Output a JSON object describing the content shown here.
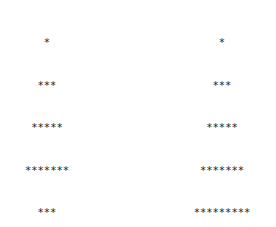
{
  "trees": [
    {
      "id": "left",
      "rows": [
        "*",
        "***",
        "*****",
        "*******",
        "***",
        "*****",
        "*******",
        "*********",
        "*****",
        "*******",
        "*********",
        "***********",
        "*",
        "*",
        "*******"
      ]
    },
    {
      "id": "right",
      "rows": [
        "*",
        "***",
        "*****",
        "*******",
        "*********",
        "*****",
        "*******",
        "*********",
        "***********",
        "*************",
        "*",
        "*",
        "*******"
      ]
    }
  ]
}
